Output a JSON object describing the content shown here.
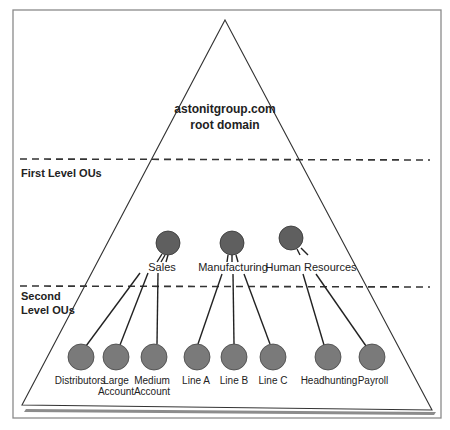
{
  "diagram": {
    "title_line1": "astonitgroup.com",
    "title_line2": "root domain",
    "levels": {
      "first": "First Level OUs",
      "second_line1": "Second",
      "second_line2": "Level OUs"
    },
    "first_level_ous": [
      {
        "label": "Sales"
      },
      {
        "label": "Manufacturing"
      },
      {
        "label": "Human Resources"
      }
    ],
    "second_level_ous": [
      {
        "label_line1": "Distributors",
        "label_line2": "",
        "parent": "Sales"
      },
      {
        "label_line1": "Large",
        "label_line2": "Account",
        "parent": "Sales"
      },
      {
        "label_line1": "Medium",
        "label_line2": "Account",
        "parent": "Sales"
      },
      {
        "label_line1": "Line A",
        "label_line2": "",
        "parent": "Manufacturing"
      },
      {
        "label_line1": "Line B",
        "label_line2": "",
        "parent": "Manufacturing"
      },
      {
        "label_line1": "Line C",
        "label_line2": "",
        "parent": "Manufacturing"
      },
      {
        "label_line1": "Headhunting",
        "label_line2": "",
        "parent": "Human Resources"
      },
      {
        "label_line1": "Payroll",
        "label_line2": "",
        "parent": "Human Resources"
      }
    ],
    "colors": {
      "node_first": "#5f5f5f",
      "node_second": "#7a7a7a",
      "line": "#222222",
      "frame": "#8a8a8a",
      "shadow": "#8c8c8c"
    }
  }
}
